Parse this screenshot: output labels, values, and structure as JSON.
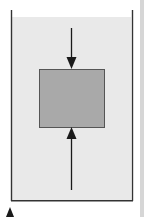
{
  "diagram": {
    "type": "submerged-block-pressure-forces",
    "colors": {
      "background": "#ffffff",
      "liquid": "#e9e9e9",
      "block_fill": "#a9a9a9",
      "block_border": "#555555",
      "container_wall": "#333333",
      "arrow": "#1a1a1a",
      "side_stripe": "#d6d6d6"
    },
    "container": {
      "left": 11,
      "right": 132,
      "top": 10,
      "bottom": 201,
      "liquid_surface_y": 17
    },
    "block": {
      "x": 39,
      "y": 69,
      "width": 65,
      "height": 58
    },
    "arrows": [
      {
        "id": "downward-force",
        "direction": "down",
        "x": 71,
        "y_start": 28,
        "y_end": 68
      },
      {
        "id": "upward-force",
        "direction": "up",
        "x": 71,
        "y_start": 190,
        "y_end": 128
      }
    ],
    "marker": {
      "shape": "triangle-up",
      "x": 10,
      "y": 207
    }
  }
}
